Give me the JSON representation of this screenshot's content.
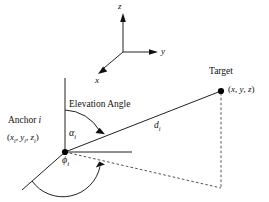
{
  "figure": {
    "kind": "3d-geometry-diagram",
    "background_color": "#ffffff",
    "line_color": "#222222",
    "dash_color": "#555555"
  },
  "axes": {
    "z_label": "z",
    "y_label": "y",
    "x_label": "x"
  },
  "anchor": {
    "name_label": "Anchor",
    "name_index": "i",
    "coord_open": "(",
    "coord_x": "x",
    "coord_x_sub": "i",
    "coord_sep1": ", ",
    "coord_y": "y",
    "coord_y_sub": "i",
    "coord_sep2": ", ",
    "coord_z": "z",
    "coord_z_sub": "i",
    "coord_close": ")"
  },
  "target": {
    "name_label": "Target",
    "coord_open": "(",
    "coord_x": "x",
    "coord_sep1": ", ",
    "coord_y": "y",
    "coord_sep2": ", ",
    "coord_z": "z",
    "coord_close": ")"
  },
  "annotations": {
    "elevation_angle_text": "Elevation Angle",
    "elevation_symbol": "α",
    "elevation_symbol_sub": "i",
    "azimuth_symbol": "ϕ",
    "azimuth_symbol_sub": "i",
    "distance_symbol": "d",
    "distance_symbol_sub": "i"
  }
}
